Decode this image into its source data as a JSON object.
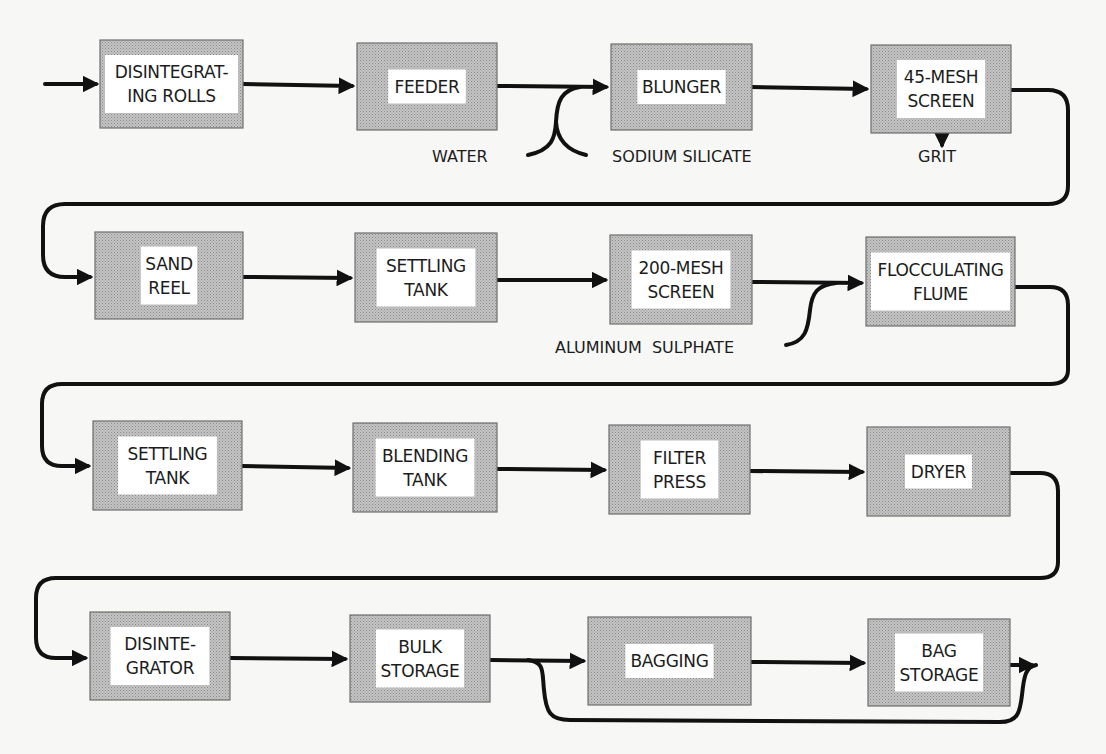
{
  "diagram": {
    "type": "process-flow",
    "colors": {
      "box_fill": "#b9b9b9",
      "box_border": "#6e6e6e",
      "label_bg": "#ffffff",
      "line": "#111111",
      "background": "#f7f7f5"
    },
    "rows": [
      {
        "boxes": [
          {
            "id": "disintegrating-rolls",
            "lines": [
              "DISINTEGRAT-",
              "ING ROLLS"
            ],
            "x": 100,
            "y": 40,
            "w": 143,
            "h": 88
          },
          {
            "id": "feeder",
            "lines": [
              "FEEDER"
            ],
            "x": 357,
            "y": 43,
            "w": 140,
            "h": 87
          },
          {
            "id": "blunger",
            "lines": [
              "BLUNGER"
            ],
            "x": 611,
            "y": 44,
            "w": 141,
            "h": 86
          },
          {
            "id": "45-mesh-screen",
            "lines": [
              "45-MESH",
              "SCREEN"
            ],
            "x": 871,
            "y": 45,
            "w": 140,
            "h": 88
          }
        ]
      },
      {
        "boxes": [
          {
            "id": "sand-reel",
            "lines": [
              "SAND",
              "REEL"
            ],
            "x": 95,
            "y": 232,
            "w": 148,
            "h": 87
          },
          {
            "id": "settling-tank-1",
            "lines": [
              "SETTLING",
              "TANK"
            ],
            "x": 355,
            "y": 233,
            "w": 142,
            "h": 89
          },
          {
            "id": "200-mesh-screen",
            "lines": [
              "200-MESH",
              "SCREEN"
            ],
            "x": 610,
            "y": 235,
            "w": 142,
            "h": 89
          },
          {
            "id": "flocculating-flume",
            "lines": [
              "FLOCCULATING",
              "FLUME"
            ],
            "x": 866,
            "y": 237,
            "w": 149,
            "h": 89
          }
        ]
      },
      {
        "boxes": [
          {
            "id": "settling-tank-2",
            "lines": [
              "SETTLING",
              "TANK"
            ],
            "x": 93,
            "y": 421,
            "w": 149,
            "h": 89
          },
          {
            "id": "blending-tank",
            "lines": [
              "BLENDING",
              "TANK"
            ],
            "x": 353,
            "y": 423,
            "w": 144,
            "h": 89
          },
          {
            "id": "filter-press",
            "lines": [
              "FILTER",
              "PRESS"
            ],
            "x": 609,
            "y": 425,
            "w": 141,
            "h": 89
          },
          {
            "id": "dryer",
            "lines": [
              "DRYER"
            ],
            "x": 867,
            "y": 427,
            "w": 143,
            "h": 89
          }
        ]
      },
      {
        "boxes": [
          {
            "id": "disintegrator",
            "lines": [
              "DISINTE-",
              "GRATOR"
            ],
            "x": 90,
            "y": 612,
            "w": 140,
            "h": 88
          },
          {
            "id": "bulk-storage",
            "lines": [
              "BULK",
              "STORAGE"
            ],
            "x": 350,
            "y": 615,
            "w": 140,
            "h": 87
          },
          {
            "id": "bagging",
            "lines": [
              "BAGGING"
            ],
            "x": 588,
            "y": 617,
            "w": 163,
            "h": 88
          },
          {
            "id": "bag-storage",
            "lines": [
              "BAG",
              "STORAGE"
            ],
            "x": 868,
            "y": 619,
            "w": 142,
            "h": 87
          }
        ]
      }
    ],
    "side_inputs": [
      {
        "id": "water",
        "label": "WATER",
        "x": 432,
        "y": 162
      },
      {
        "id": "sodium-silicate",
        "label": "SODIUM SILICATE",
        "x": 612,
        "y": 162
      },
      {
        "id": "grit",
        "label": "GRIT",
        "x": 918,
        "y": 162
      },
      {
        "id": "aluminum-sulphate",
        "label": "ALUMINUM  SULPHATE",
        "x": 555,
        "y": 353
      }
    ]
  }
}
